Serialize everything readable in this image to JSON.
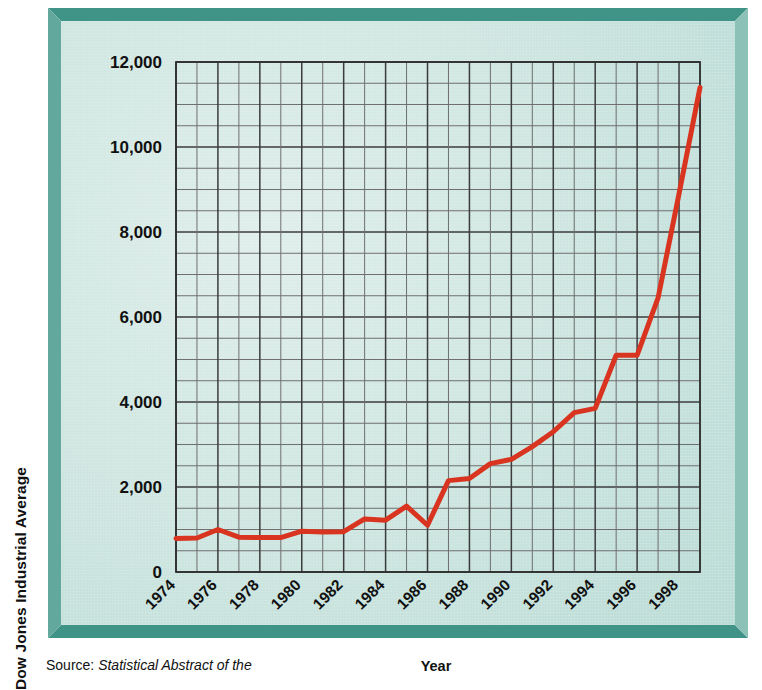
{
  "figure": {
    "source_prefix": "Source: ",
    "source_title": "Statistical Abstract of the",
    "frame_color": "#3f9387",
    "panel_color": "#cfe6e1",
    "line_color": "#d83420",
    "grid_color": "#4a4a4a"
  },
  "chart_data": {
    "type": "line",
    "title": "",
    "xlabel": "Year",
    "ylabel": "Dow Jones Industrial Average",
    "xlim": [
      1974,
      1999
    ],
    "ylim": [
      0,
      12000
    ],
    "grid": true,
    "legend": "none",
    "y_ticks": [
      0,
      2000,
      4000,
      6000,
      8000,
      10000,
      12000
    ],
    "y_tick_labels": [
      "0",
      "2,000",
      "4,000",
      "6,000",
      "8,000",
      "10,000",
      "12,000"
    ],
    "y_minor_step": 500,
    "x_ticks": [
      1974,
      1976,
      1978,
      1980,
      1982,
      1984,
      1986,
      1988,
      1990,
      1992,
      1994,
      1996,
      1998
    ],
    "x_tick_labels": [
      "1974",
      "1976",
      "1978",
      "1980",
      "1982",
      "1984",
      "1986",
      "1988",
      "1990",
      "1992",
      "1994",
      "1996",
      "1998"
    ],
    "x_minor_step": 1,
    "series": [
      {
        "name": "Dow Jones Industrial Average",
        "color": "#d83420",
        "x": [
          1974,
          1975,
          1976,
          1977,
          1978,
          1979,
          1980,
          1981,
          1982,
          1983,
          1984,
          1985,
          1986,
          1987,
          1988,
          1989,
          1990,
          1991,
          1992,
          1993,
          1994,
          1995,
          1996,
          1997,
          1998,
          1999
        ],
        "values": [
          790,
          800,
          1000,
          820,
          810,
          810,
          960,
          940,
          950,
          1250,
          1220,
          1550,
          1100,
          2150,
          2200,
          2550,
          2650,
          2950,
          3300,
          3750,
          3850,
          5100,
          5100,
          6450,
          8900,
          11400
        ]
      }
    ]
  }
}
